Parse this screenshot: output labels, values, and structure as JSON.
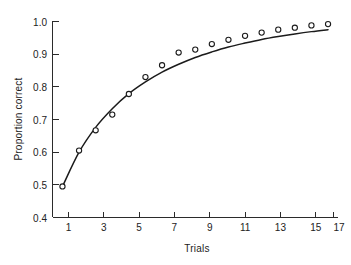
{
  "chart_data": {
    "type": "line",
    "title": "",
    "xlabel": "Trials",
    "ylabel": "Proportion correct",
    "xlim": [
      0.4,
      17.6
    ],
    "ylim": [
      0.4,
      1.0
    ],
    "grid": false,
    "legend": "none",
    "x_ticks_major": [
      1,
      3,
      5,
      7,
      9,
      11,
      13,
      15,
      17
    ],
    "x_tick_labels": [
      "1",
      "3",
      "5",
      "7",
      "9",
      "11",
      "13",
      "15",
      "17"
    ],
    "x_ticks_all": [
      1,
      2,
      3,
      4,
      5,
      6,
      7,
      8,
      9,
      10,
      11,
      12,
      13,
      14,
      15,
      16,
      17
    ],
    "y_ticks": [
      0.4,
      0.5,
      0.6,
      0.7,
      0.8,
      0.9,
      1.0
    ],
    "y_tick_labels": [
      "0.4",
      "0.5",
      "0.6",
      "0.7",
      "0.8",
      "0.9",
      "1.0"
    ],
    "x": [
      1,
      2,
      3,
      4,
      5,
      6,
      7,
      8,
      9,
      10,
      11,
      12,
      13,
      14,
      15,
      16,
      17
    ],
    "values": [
      0.495,
      0.605,
      0.667,
      0.715,
      0.778,
      0.83,
      0.866,
      0.905,
      0.914,
      0.931,
      0.944,
      0.956,
      0.966,
      0.975,
      0.981,
      0.988,
      0.992
    ],
    "series": [
      {
        "name": "Observed proportion correct",
        "marker": "open-circle",
        "values": [
          0.495,
          0.605,
          0.667,
          0.715,
          0.778,
          0.83,
          0.866,
          0.905,
          0.914,
          0.931,
          0.944,
          0.956,
          0.966,
          0.975,
          0.981,
          0.988,
          0.992
        ]
      },
      {
        "name": "Fitted learning curve",
        "marker": "none",
        "values": [
          0.495,
          0.6,
          0.676,
          0.733,
          0.779,
          0.815,
          0.845,
          0.869,
          0.89,
          0.907,
          0.922,
          0.934,
          0.945,
          0.954,
          0.962,
          0.969,
          0.975
        ]
      }
    ],
    "annotations": []
  },
  "figure": {
    "background_color": "#ffffff",
    "line_color": "#1b1b1b",
    "marker_face_color": "#ffffff",
    "axis_color": "#2b2b2b"
  }
}
